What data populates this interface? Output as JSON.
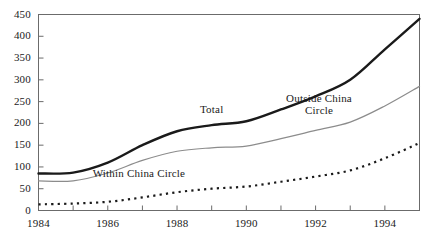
{
  "chart_data": {
    "type": "line",
    "title": "",
    "xlabel": "",
    "ylabel": "",
    "xlim": [
      1984,
      1995
    ],
    "ylim": [
      0,
      450
    ],
    "grid": false,
    "legend_position": "inline-annotations",
    "yticks": [
      0,
      50,
      100,
      150,
      200,
      250,
      300,
      350,
      400,
      450
    ],
    "ytick_labels": [
      "0",
      "50",
      "100",
      "150",
      "200",
      "250",
      "300",
      "350",
      "400",
      "450"
    ],
    "xticks": [
      1984,
      1985,
      1986,
      1987,
      1988,
      1989,
      1990,
      1991,
      1992,
      1993,
      1994,
      1995
    ],
    "xtick_labels_shown": [
      "1984",
      "1986",
      "1988",
      "1990",
      "1992",
      "1994"
    ],
    "xtick_labels_shown_values": [
      1984,
      1986,
      1988,
      1990,
      1992,
      1994
    ],
    "x": [
      1984,
      1985,
      1986,
      1987,
      1988,
      1989,
      1990,
      1991,
      1992,
      1993,
      1994,
      1995
    ],
    "series": [
      {
        "name": "Total",
        "style": "solid-thick",
        "color": "#1a1a1a",
        "values": [
          85,
          87,
          110,
          150,
          182,
          196,
          205,
          232,
          262,
          300,
          370,
          440
        ],
        "label_x": 1989.0,
        "label_y": 232
      },
      {
        "name": "Outside China Circle",
        "style": "solid-thin",
        "color": "#8c8c8c",
        "values": [
          68,
          68,
          86,
          115,
          136,
          144,
          148,
          165,
          184,
          203,
          240,
          285
        ],
        "label_x": 1992.1,
        "label_y": 258
      },
      {
        "name": "Within China Circle",
        "style": "dotted",
        "color": "#1a1a1a",
        "values": [
          14,
          16,
          20,
          30,
          42,
          50,
          55,
          66,
          78,
          92,
          120,
          155
        ],
        "label_x": 1986.9,
        "label_y": 86
      }
    ]
  },
  "axis": {
    "ytick_labels": [
      "450",
      "400",
      "350",
      "300",
      "250",
      "200",
      "150",
      "100",
      "50",
      "0"
    ],
    "xtick_labels": [
      "1984",
      "1986",
      "1988",
      "1990",
      "1992",
      "1994"
    ]
  },
  "annotations": {
    "total": "Total",
    "outside": "Outside China\nCircle",
    "within": "Within China Circle"
  },
  "colors": {
    "total_line": "#1a1a1a",
    "outside_line": "#8c8c8c",
    "within_line": "#1a1a1a",
    "frame": "#6b6b6b",
    "text": "#1a1a1a"
  }
}
